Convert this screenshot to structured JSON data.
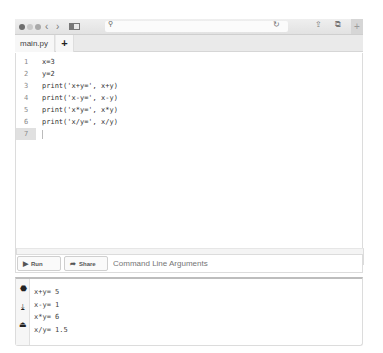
{
  "browser": {
    "nav_back": "‹",
    "nav_forward": "›",
    "search_icon": "⚲",
    "reload_icon": "↻",
    "share_icon": "⇪",
    "tabs_icon": "⧉",
    "new_tab_icon": "+",
    "colors": {
      "chrome": "#e6e6e6",
      "url_bar": "#fbfbfb"
    }
  },
  "tabs": [
    {
      "label": "main.py",
      "active": true
    }
  ],
  "add_tab_label": "+",
  "editor": {
    "lines": [
      {
        "number": "1",
        "code": "x=3"
      },
      {
        "number": "2",
        "code": "y=2"
      },
      {
        "number": "3",
        "code": "print('x+y=', x+y)"
      },
      {
        "number": "4",
        "code": "print('x-y=', x-y)"
      },
      {
        "number": "5",
        "code": "print('x*y=', x*y)"
      },
      {
        "number": "6",
        "code": "print('x/y=', x/y)"
      },
      {
        "number": "7",
        "code": ""
      }
    ],
    "active_line": 7
  },
  "status": {
    "position": "Ln: 7,  Col: 1"
  },
  "toolbar": {
    "run_label": "Run",
    "run_icon": "▶",
    "share_label": "Share",
    "share_icon": "➦",
    "args_placeholder": "Command Line Arguments"
  },
  "output": {
    "side_icons": [
      "stop-icon",
      "download-icon",
      "upload-icon"
    ],
    "side_glyphs": [
      "⬣",
      "⤓",
      "⏏"
    ],
    "lines": [
      "x+y= 5",
      "x-y= 1",
      "x*y= 6",
      "x/y= 1.5"
    ]
  }
}
